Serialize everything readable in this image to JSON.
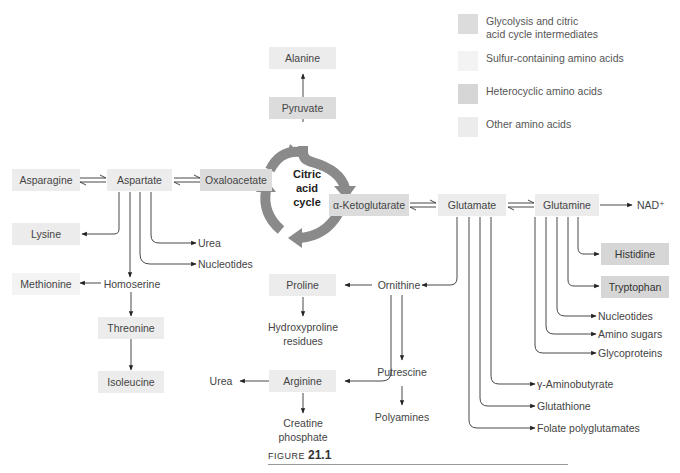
{
  "legend": [
    {
      "category": "glyco",
      "label_line1": "Glycolysis and citric",
      "label_line2": "acid cycle intermediates",
      "color": "#dcdcdc"
    },
    {
      "category": "sulfur",
      "label_line1": "Sulfur-containing amino acids",
      "label_line2": "",
      "color": "#f3f3f3"
    },
    {
      "category": "hetero",
      "label_line1": "Heterocyclic amino acids",
      "label_line2": "",
      "color": "#d6d6d6"
    },
    {
      "category": "other",
      "label_line1": "Other amino acids",
      "label_line2": "",
      "color": "#ececec"
    }
  ],
  "cycle": {
    "line1": "Citric",
    "line2": "acid",
    "line3": "cycle"
  },
  "nodes": {
    "alanine": "Alanine",
    "pyruvate": "Pyruvate",
    "asparagine": "Asparagine",
    "aspartate": "Aspartate",
    "oxaloacetate": "Oxaloacetate",
    "ketoglutarate": "α-Ketoglutarate",
    "glutamate": "Glutamate",
    "glutamine": "Glutamine",
    "nad": "NAD⁺",
    "lysine": "Lysine",
    "urea1": "Urea",
    "nucleotides1": "Nucleotides",
    "methionine": "Methionine",
    "homoserine": "Homoserine",
    "threonine": "Threonine",
    "isoleucine": "Isoleucine",
    "histidine": "Histidine",
    "tryptophan": "Tryptophan",
    "nucleotides2": "Nucleotides",
    "amino_sugars": "Amino sugars",
    "glycoproteins": "Glycoproteins",
    "proline": "Proline",
    "ornithine": "Ornithine",
    "hydroxyproline_1": "Hydroxyproline",
    "hydroxyproline_2": "residues",
    "urea2": "Urea",
    "arginine": "Arginine",
    "creatine_1": "Creatine",
    "creatine_2": "phosphate",
    "putrescine": "Putrescine",
    "polyamines": "Polyamines",
    "gaba": "γ-Aminobutyrate",
    "glutathione": "Glutathione",
    "folate": "Folate polyglutamates"
  },
  "caption": {
    "prefix": "FIGURE ",
    "number": "21.1"
  }
}
